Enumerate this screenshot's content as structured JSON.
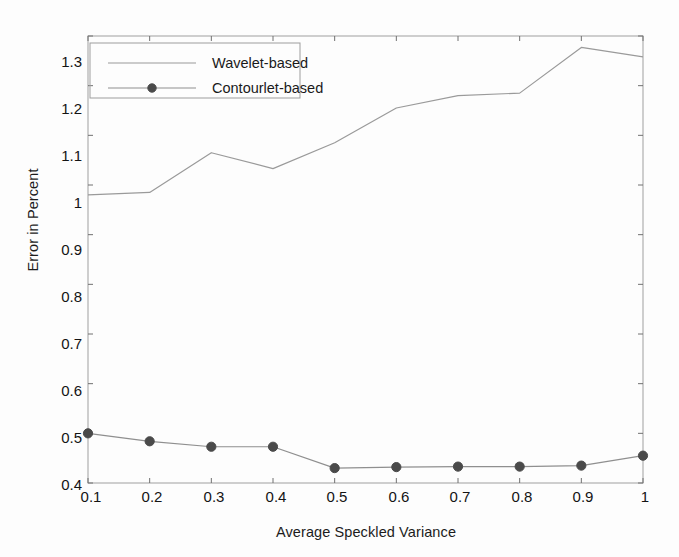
{
  "chart_data": {
    "type": "line",
    "title": "",
    "xlabel": "Average Speckled Variance",
    "ylabel": "Error in Percent",
    "x": [
      0.1,
      0.2,
      0.3,
      0.4,
      0.5,
      0.6,
      0.7,
      0.8,
      0.9,
      1.0
    ],
    "xlim": [
      0.1,
      1.0
    ],
    "ylim": [
      0.4,
      1.3
    ],
    "xticks": [
      "0.1",
      "0.2",
      "0.3",
      "0.4",
      "0.5",
      "0.6",
      "0.7",
      "0.8",
      "0.9",
      "1"
    ],
    "yticks": [
      "0.4",
      "0.5",
      "0.6",
      "0.7",
      "0.8",
      "0.9",
      "1",
      "1.1",
      "1.2",
      "1.3"
    ],
    "grid": false,
    "legend_position": "upper-left",
    "series": [
      {
        "name": "Wavelet-based",
        "values": [
          0.98,
          0.985,
          1.065,
          1.033,
          1.085,
          1.155,
          1.18,
          1.185,
          1.277,
          1.258
        ],
        "color": "#9a9a9a",
        "marker": "none",
        "line_style": "solid"
      },
      {
        "name": "Contourlet-based",
        "values": [
          0.5,
          0.484,
          0.473,
          0.473,
          0.43,
          0.432,
          0.433,
          0.433,
          0.435,
          0.455
        ],
        "color": "#8f8f8f",
        "marker": "circle",
        "marker_color": "#4a4a4a",
        "line_style": "solid"
      }
    ]
  },
  "legend": {
    "entries": [
      {
        "label": "Wavelet-based"
      },
      {
        "label": "Contourlet-based"
      }
    ]
  },
  "axes": {
    "frame_color": "#a8a8a8",
    "tick_color": "#707070"
  }
}
